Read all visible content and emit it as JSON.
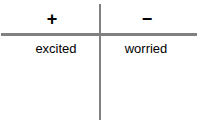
{
  "diagram": {
    "type": "valence-axis-cross",
    "colors": {
      "axis": "#808080",
      "text": "#000000",
      "background": "#ffffff"
    },
    "axes": {
      "horizontal": {
        "name": "horizontal-divider"
      },
      "vertical": {
        "name": "vertical-divider"
      }
    },
    "quadrants": {
      "top_left": {
        "symbol": "+"
      },
      "top_right": {
        "symbol": "−"
      },
      "bottom_left": {
        "label": "excited"
      },
      "bottom_right": {
        "label": "worried"
      }
    }
  }
}
